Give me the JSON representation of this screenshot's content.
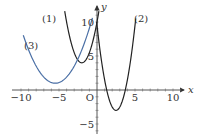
{
  "chart_data": {
    "type": "line",
    "title": "",
    "xlabel": "x",
    "ylabel": "y",
    "origin_label": "O",
    "xlim": [
      -11,
      11
    ],
    "ylim": [
      -5.5,
      11
    ],
    "x_ticks": [
      -10,
      -5,
      5,
      10
    ],
    "x_tick_labels": [
      "−10",
      "−5",
      "5",
      "10"
    ],
    "y_ticks": [
      10,
      5,
      -5
    ],
    "y_tick_labels": [
      "10",
      "5",
      "−5"
    ],
    "grid": false,
    "legend": "inline labels",
    "series": [
      {
        "name": "(1)",
        "color": "#222222",
        "form": "y = 1.5(x + 2)^2 + 4",
        "vertex": [
          -2,
          4
        ],
        "x": [
          -4.3,
          -4,
          -3,
          -2,
          -1,
          0,
          0.3
        ],
        "y": [
          11.9,
          10,
          5.5,
          4,
          5.5,
          10,
          11.9
        ]
      },
      {
        "name": "(2)",
        "color": "#222222",
        "form": "y = 2(x - 2.5)^2 - 3",
        "vertex": [
          2.5,
          -3
        ],
        "x": [
          0,
          1,
          2,
          2.5,
          3,
          4,
          5,
          5.5
        ],
        "y": [
          9.5,
          1.5,
          -2.5,
          -3,
          -2.5,
          1.5,
          9.5,
          15
        ]
      },
      {
        "name": "(3)",
        "color": "#4a6fa5",
        "form": "y = 0.4(x + 5.5)^2 + 1",
        "vertex": [
          -5.5,
          1
        ],
        "x": [
          -9.7,
          -8,
          -7,
          -5.5,
          -4,
          -3,
          -2,
          -1,
          -0.6
        ],
        "y": [
          8.1,
          3.5,
          1.9,
          1,
          1.9,
          3.5,
          5.9,
          9.1,
          10.6
        ]
      }
    ]
  }
}
